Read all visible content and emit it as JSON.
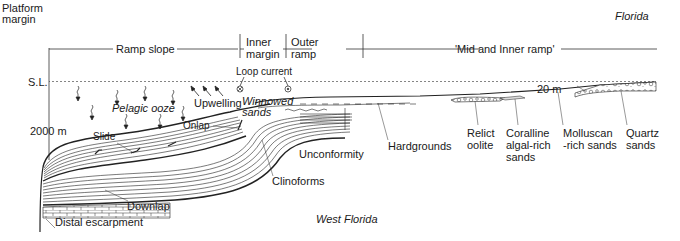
{
  "diagram": {
    "type": "geological-cross-section",
    "region_top_right": "Florida",
    "region_bottom": "West Florida",
    "zones": {
      "platform_margin": "Platform\nmargin",
      "ramp_slope": "Ramp slope",
      "inner_margin": "Inner\nmargin",
      "outer_ramp": "Outer\nramp",
      "mid_inner_ramp": "'Mid and Inner ramp'"
    },
    "depth_labels": {
      "sea_level": "S.L.",
      "depth_2000": "2000 m",
      "depth_20": "20 m"
    },
    "process_labels": {
      "loop_current": "Loop current",
      "pelagic_ooze": "Pelagic ooze",
      "upwelling": "Upwelling",
      "winnowed_sands": "Winnowed\nsands",
      "onlap": "Onlap",
      "slide": "Slide"
    },
    "feature_labels": {
      "unconformity": "Unconformity",
      "clinoforms": "Clinoforms",
      "downlap": "Downlap",
      "distal_escarpment": "Distal escarpment",
      "hardgrounds": "Hardgrounds"
    },
    "facies_labels": {
      "relict_oolite": "Relict\noolite",
      "coralline": "Coralline\nalgal-rich\nsands",
      "molluscan": "Molluscan\n-rich sands",
      "quartz": "Quartz\nsands"
    }
  }
}
